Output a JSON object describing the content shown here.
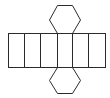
{
  "diagram": {
    "type": "net-of-hexagonal-prism",
    "stroke_color": "#2b2b2b",
    "fill_color": "#ffffff",
    "rectangle_faces": 6,
    "hexagon_faces": 2
  }
}
